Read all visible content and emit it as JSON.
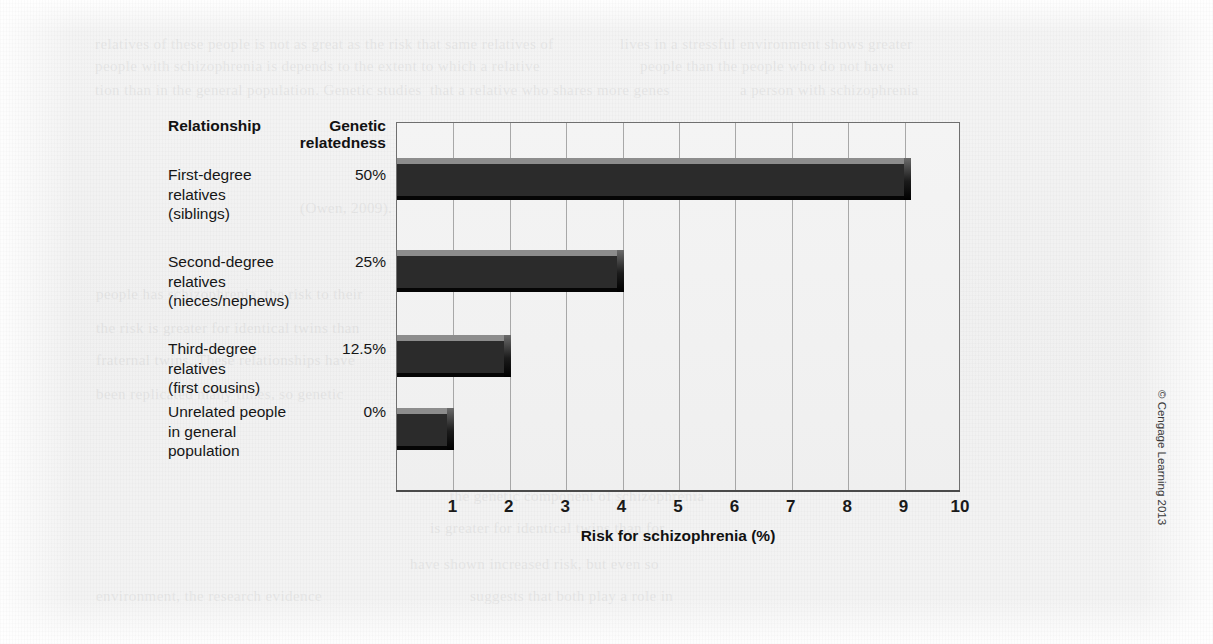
{
  "figure": {
    "columns": {
      "relationship_header": "Relationship",
      "genetic_header_line1": "Genetic",
      "genetic_header_line2": "relatedness"
    },
    "axis_title": "Risk for schizophrenia (%)",
    "credit": "© Cengage Learning 2013",
    "bar_color": "#2b2b2b",
    "bar_highlight_color": "#8d8d8d",
    "plot_background": "#f1f1f1",
    "grid_color": "#8a8a8a"
  },
  "rows": [
    {
      "label_lines": [
        "First-degree",
        "relatives",
        "(siblings)"
      ],
      "label_text": "First-degree relatives (siblings)",
      "genetic_relatedness": "50%",
      "risk": 9.1
    },
    {
      "label_lines": [
        "Second-degree",
        "relatives",
        "(nieces/nephews)"
      ],
      "label_text": "Second-degree relatives (nieces/nephews)",
      "genetic_relatedness": "25%",
      "risk": 4.0
    },
    {
      "label_lines": [
        "Third-degree",
        "relatives",
        "(first cousins)"
      ],
      "label_text": "Third-degree relatives (first cousins)",
      "genetic_relatedness": "12.5%",
      "risk": 2.0
    },
    {
      "label_lines": [
        "Unrelated people",
        "in general",
        "population"
      ],
      "label_text": "Unrelated people in general population",
      "genetic_relatedness": "0%",
      "risk": 1.0
    }
  ],
  "ticks": [
    "1",
    "2",
    "3",
    "4",
    "5",
    "6",
    "7",
    "8",
    "9",
    "10"
  ],
  "chart_data": {
    "type": "bar",
    "orientation": "horizontal",
    "title": "",
    "xlabel": "Risk for schizophrenia (%)",
    "ylabel": "",
    "categories": [
      "First-degree relatives (siblings)",
      "Second-degree relatives (nieces/nephews)",
      "Third-degree relatives (first cousins)",
      "Unrelated people in general population"
    ],
    "values": [
      9.1,
      4.0,
      2.0,
      1.0
    ],
    "secondary_labels": {
      "name": "Genetic relatedness",
      "values": [
        "50%",
        "25%",
        "12.5%",
        "0%"
      ]
    },
    "xlim": [
      0,
      10
    ],
    "xticks": [
      1,
      2,
      3,
      4,
      5,
      6,
      7,
      8,
      9,
      10
    ],
    "grid": true,
    "grid_axis": "x",
    "legend": false
  },
  "ghost_text": [
    {
      "x": 95,
      "y": 36,
      "t": "relatives of these people is not as great as the risk that same relatives of"
    },
    {
      "x": 620,
      "y": 36,
      "t": "lives in a stressful environment shows greater"
    },
    {
      "x": 95,
      "y": 58,
      "t": "people with schizophrenia is depends to the extent to which a relative"
    },
    {
      "x": 640,
      "y": 58,
      "t": "people than the people who do not have"
    },
    {
      "x": 95,
      "y": 82,
      "t": "tion than in the general population. Genetic studies"
    },
    {
      "x": 430,
      "y": 82,
      "t": "that a relative who shares more genes"
    },
    {
      "x": 740,
      "y": 82,
      "t": "a person with schizophrenia"
    },
    {
      "x": 430,
      "y": 126,
      "t": "have not been conclusive, but several"
    },
    {
      "x": 470,
      "y": 162,
      "t": "genes are being investigated"
    },
    {
      "x": 300,
      "y": 200,
      "t": "(Owen, 2009)."
    },
    {
      "x": 440,
      "y": 244,
      "t": "Environment. The environment"
    },
    {
      "x": 96,
      "y": 286,
      "t": "people has schizophrenia, the risk to their"
    },
    {
      "x": 470,
      "y": 286,
      "t": "to the development of schizophrenia, and"
    },
    {
      "x": 96,
      "y": 320,
      "t": "the risk is greater for identical twins than"
    },
    {
      "x": 500,
      "y": 320,
      "t": "some researchers believe that environmental"
    },
    {
      "x": 96,
      "y": 352,
      "t": "fraternal twins. These relationships have"
    },
    {
      "x": 520,
      "y": 352,
      "t": "influences may be as important as"
    },
    {
      "x": 96,
      "y": 386,
      "t": "been replicated many times, so genetic"
    },
    {
      "x": 520,
      "y": 386,
      "t": "genetic ones. Children born in"
    },
    {
      "x": 450,
      "y": 418,
      "t": "winter are at slightly greater risk"
    },
    {
      "x": 430,
      "y": 452,
      "t": "relatives at a greater risk, growing"
    },
    {
      "x": 450,
      "y": 488,
      "t": "the genetic component of schizophrenia"
    },
    {
      "x": 430,
      "y": 520,
      "t": "is greater for identical twins than for"
    },
    {
      "x": 410,
      "y": 556,
      "t": "have shown increased risk, but even so"
    },
    {
      "x": 96,
      "y": 588,
      "t": "environment, the research evidence"
    },
    {
      "x": 470,
      "y": 588,
      "t": "suggests that both play a role in"
    }
  ]
}
